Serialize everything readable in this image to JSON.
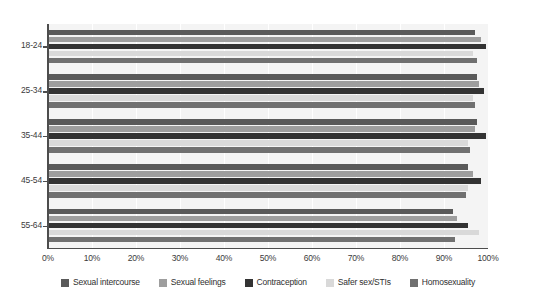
{
  "chart_data": {
    "type": "bar",
    "orientation": "horizontal",
    "title": "",
    "subtitle": "",
    "xlabel": "",
    "ylabel": "",
    "xlim": [
      0,
      100
    ],
    "xticks": [
      "0%",
      "10%",
      "20%",
      "30%",
      "40%",
      "50%",
      "60%",
      "70%",
      "80%",
      "90%",
      "100%"
    ],
    "xtick_values": [
      0,
      10,
      20,
      30,
      40,
      50,
      60,
      70,
      80,
      90,
      100
    ],
    "grid": "vertical",
    "legend_position": "bottom",
    "categories": [
      "18-24",
      "25-34",
      "35-44",
      "45-54",
      "55-64"
    ],
    "series": [
      {
        "name": "Sexual intercourse",
        "color": "#5a5a5a",
        "values": [
          97.0,
          97.5,
          97.5,
          95.5,
          92.0
        ]
      },
      {
        "name": "Sexual feelings",
        "color": "#9e9e9e",
        "values": [
          98.5,
          98.0,
          97.0,
          96.5,
          93.0
        ]
      },
      {
        "name": "Contraception",
        "color": "#333333",
        "values": [
          99.5,
          99.0,
          99.5,
          98.5,
          95.5
        ]
      },
      {
        "name": "Safer sex/STIs",
        "color": "#d9d9d9",
        "values": [
          96.5,
          96.5,
          95.5,
          95.5,
          98.0
        ]
      },
      {
        "name": "Homosexuality",
        "color": "#707070",
        "values": [
          97.5,
          97.0,
          96.0,
          95.0,
          92.5
        ]
      }
    ]
  },
  "axis": {
    "spine_color": "#4d4d4d",
    "plot_background": "#f4f4f4",
    "gridline_color": "#ffffff"
  },
  "legend": {
    "items": [
      {
        "label": "Sexual intercourse",
        "color": "#5a5a5a"
      },
      {
        "label": "Sexual feelings",
        "color": "#9e9e9e"
      },
      {
        "label": "Contraception",
        "color": "#333333"
      },
      {
        "label": "Safer sex/STIs",
        "color": "#d9d9d9"
      },
      {
        "label": "Homosexuality",
        "color": "#707070"
      }
    ]
  }
}
